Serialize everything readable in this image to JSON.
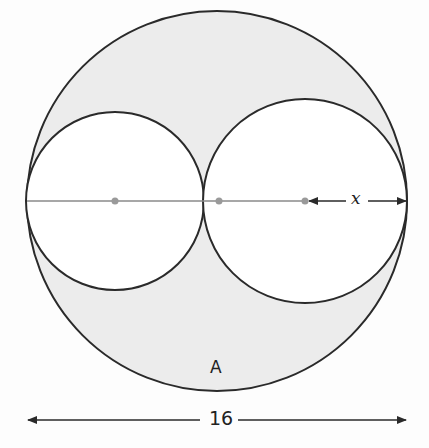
{
  "figure": {
    "region_label": "A",
    "width_label": "16",
    "radius_label": "x",
    "colors": {
      "shaded_region": "#ececec",
      "outline": "#2a2a2a",
      "center_dots": "#9a9a9a",
      "diameter_line": "#8a8a8a"
    }
  },
  "geometry": {
    "outer_circle": {
      "cx": 217,
      "cy": 201,
      "r": 190,
      "diameter_value": 16
    },
    "left_circle": {
      "cx": 115,
      "cy": 201,
      "r": 89
    },
    "right_circle": {
      "cx": 305,
      "cy": 201,
      "r": 102,
      "radius_symbol": "x"
    },
    "center_dots": [
      115,
      219,
      305
    ],
    "shaded_region_name": "A"
  }
}
